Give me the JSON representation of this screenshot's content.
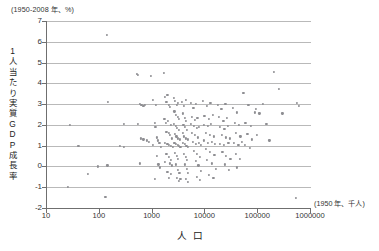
{
  "chart_data": {
    "type": "scatter",
    "title": "",
    "unit_note_y": "(1950-2008 年、%)",
    "unit_note_x": "(1950 年、千人)",
    "ylabel": "1人当たり実質GDP成長率",
    "ylabel_chars": [
      "1",
      "人",
      "当",
      "た",
      "り",
      "実",
      "質",
      "G",
      "D",
      "P",
      "成",
      "長",
      "率"
    ],
    "xlabel": "人　口",
    "xlabel_left": "人",
    "xlabel_right": "口",
    "xscale": "log",
    "yscale": "linear",
    "xlim": [
      10,
      1000000
    ],
    "ylim": [
      -2,
      7
    ],
    "xticks": [
      10,
      100,
      1000,
      10000,
      100000,
      1000000
    ],
    "xticklabels": [
      "10",
      "100",
      "1000",
      "10000",
      "100000",
      "1000000"
    ],
    "yticks": [
      -2,
      -1,
      0,
      1,
      2,
      3,
      4,
      5,
      6,
      7
    ],
    "yticklabels": [
      "-2",
      "-1",
      "0",
      "1",
      "2",
      "3",
      "4",
      "5",
      "6",
      "7"
    ],
    "grid": "horizontal",
    "legend": "none",
    "marker_color": "#8e8e92",
    "axis_color": "#6f6f6f",
    "grid_color": "#b9b9b9",
    "points": [
      [
        28,
        2.0
      ],
      [
        41,
        1.0
      ],
      [
        26,
        -1.0
      ],
      [
        140,
        6.35
      ],
      [
        150,
        3.1
      ],
      [
        95,
        0.0
      ],
      [
        145,
        0.05
      ],
      [
        62,
        -0.35
      ],
      [
        133,
        -1.45
      ],
      [
        300,
        2.05
      ],
      [
        255,
        1.0
      ],
      [
        300,
        0.95
      ],
      [
        520,
        4.45
      ],
      [
        560,
        4.4
      ],
      [
        590,
        3.0
      ],
      [
        640,
        2.95
      ],
      [
        700,
        2.9
      ],
      [
        760,
        2.95
      ],
      [
        620,
        1.35
      ],
      [
        700,
        1.3
      ],
      [
        560,
        2.05
      ],
      [
        820,
        1.25
      ],
      [
        900,
        1.2
      ],
      [
        600,
        0.15
      ],
      [
        980,
        4.35
      ],
      [
        1050,
        3.2
      ],
      [
        1200,
        2.95
      ],
      [
        1150,
        2.1
      ],
      [
        1180,
        1.9
      ],
      [
        1250,
        1.4
      ],
      [
        1320,
        1.25
      ],
      [
        1050,
        1.05
      ],
      [
        1400,
        1.15
      ],
      [
        1500,
        0.95
      ],
      [
        1250,
        0.5
      ],
      [
        1350,
        0.1
      ],
      [
        1450,
        -0.05
      ],
      [
        1150,
        -0.6
      ],
      [
        1700,
        4.5
      ],
      [
        1800,
        3.35
      ],
      [
        1900,
        3.1
      ],
      [
        2000,
        3.45
      ],
      [
        2100,
        2.95
      ],
      [
        2200,
        2.85
      ],
      [
        1750,
        2.3
      ],
      [
        1850,
        2.1
      ],
      [
        2050,
        2.2
      ],
      [
        2300,
        2.0
      ],
      [
        1900,
        1.65
      ],
      [
        2100,
        1.6
      ],
      [
        2250,
        1.5
      ],
      [
        2400,
        1.35
      ],
      [
        1800,
        1.15
      ],
      [
        2000,
        1.1
      ],
      [
        2150,
        1.05
      ],
      [
        2350,
        1.0
      ],
      [
        2500,
        0.95
      ],
      [
        1900,
        0.6
      ],
      [
        2100,
        0.45
      ],
      [
        2300,
        0.3
      ],
      [
        1800,
        0.2
      ],
      [
        2200,
        0.15
      ],
      [
        2450,
        0.05
      ],
      [
        2000,
        -0.25
      ],
      [
        2300,
        -0.35
      ],
      [
        2150,
        -0.55
      ],
      [
        2600,
        3.3
      ],
      [
        2800,
        3.15
      ],
      [
        3000,
        2.95
      ],
      [
        3200,
        3.05
      ],
      [
        2700,
        2.65
      ],
      [
        2900,
        2.5
      ],
      [
        3100,
        2.4
      ],
      [
        3300,
        2.3
      ],
      [
        2650,
        2.05
      ],
      [
        2850,
        1.95
      ],
      [
        3050,
        1.85
      ],
      [
        3250,
        1.75
      ],
      [
        2750,
        1.55
      ],
      [
        2950,
        1.45
      ],
      [
        3150,
        1.35
      ],
      [
        3400,
        1.3
      ],
      [
        2700,
        1.15
      ],
      [
        2900,
        1.1
      ],
      [
        3100,
        1.05
      ],
      [
        3300,
        1.0
      ],
      [
        3500,
        0.95
      ],
      [
        2800,
        0.65
      ],
      [
        3000,
        0.5
      ],
      [
        3200,
        0.35
      ],
      [
        2900,
        0.1
      ],
      [
        3100,
        -0.15
      ],
      [
        3350,
        -0.3
      ],
      [
        3000,
        -0.55
      ],
      [
        3250,
        -0.7
      ],
      [
        3500,
        -0.6
      ],
      [
        3800,
        3.1
      ],
      [
        4100,
        2.9
      ],
      [
        4400,
        3.2
      ],
      [
        3900,
        2.55
      ],
      [
        4200,
        2.35
      ],
      [
        4500,
        2.2
      ],
      [
        4000,
        2.0
      ],
      [
        4300,
        1.9
      ],
      [
        4600,
        1.75
      ],
      [
        3850,
        1.6
      ],
      [
        4150,
        1.45
      ],
      [
        4450,
        1.35
      ],
      [
        4800,
        1.3
      ],
      [
        3950,
        1.15
      ],
      [
        4250,
        1.1
      ],
      [
        4550,
        1.0
      ],
      [
        4900,
        0.95
      ],
      [
        4100,
        0.6
      ],
      [
        4400,
        0.45
      ],
      [
        4700,
        0.3
      ],
      [
        4200,
        0.1
      ],
      [
        4600,
        -0.1
      ],
      [
        4950,
        -0.3
      ],
      [
        4400,
        -0.6
      ],
      [
        4800,
        -0.75
      ],
      [
        5500,
        3.05
      ],
      [
        6200,
        2.8
      ],
      [
        7000,
        3.0
      ],
      [
        5800,
        2.4
      ],
      [
        6500,
        2.25
      ],
      [
        7400,
        2.35
      ],
      [
        5600,
        2.05
      ],
      [
        6300,
        1.95
      ],
      [
        7100,
        1.85
      ],
      [
        8000,
        1.9
      ],
      [
        5900,
        1.6
      ],
      [
        6700,
        1.5
      ],
      [
        7600,
        1.4
      ],
      [
        6100,
        1.2
      ],
      [
        6900,
        1.1
      ],
      [
        7800,
        1.15
      ],
      [
        8500,
        1.05
      ],
      [
        6400,
        0.75
      ],
      [
        7300,
        0.6
      ],
      [
        8200,
        0.45
      ],
      [
        6800,
        0.25
      ],
      [
        7700,
        0.05
      ],
      [
        8700,
        -0.2
      ],
      [
        7200,
        -0.5
      ],
      [
        8300,
        -0.65
      ],
      [
        9500,
        3.15
      ],
      [
        11000,
        2.9
      ],
      [
        13000,
        3.05
      ],
      [
        10000,
        2.45
      ],
      [
        12000,
        2.3
      ],
      [
        14500,
        2.5
      ],
      [
        9800,
        2.0
      ],
      [
        11500,
        1.95
      ],
      [
        13500,
        2.05
      ],
      [
        10500,
        1.6
      ],
      [
        12500,
        1.5
      ],
      [
        15000,
        1.45
      ],
      [
        9900,
        1.25
      ],
      [
        11800,
        1.15
      ],
      [
        14000,
        1.2
      ],
      [
        16000,
        1.1
      ],
      [
        10800,
        0.85
      ],
      [
        12800,
        0.7
      ],
      [
        15500,
        0.55
      ],
      [
        11200,
        0.3
      ],
      [
        13800,
        0.15
      ],
      [
        16500,
        -0.1
      ],
      [
        12200,
        -0.4
      ],
      [
        14800,
        -0.55
      ],
      [
        18000,
        2.95
      ],
      [
        21000,
        2.75
      ],
      [
        25000,
        3.0
      ],
      [
        19000,
        2.4
      ],
      [
        23000,
        2.2
      ],
      [
        27000,
        2.35
      ],
      [
        20000,
        1.9
      ],
      [
        24000,
        1.8
      ],
      [
        28000,
        1.95
      ],
      [
        21500,
        1.5
      ],
      [
        25500,
        1.4
      ],
      [
        30000,
        1.35
      ],
      [
        19500,
        1.1
      ],
      [
        23500,
        1.05
      ],
      [
        28500,
        1.15
      ],
      [
        22000,
        0.7
      ],
      [
        26000,
        0.5
      ],
      [
        31000,
        0.35
      ],
      [
        24500,
        0.1
      ],
      [
        29000,
        -0.15
      ],
      [
        35000,
        2.8
      ],
      [
        42000,
        2.6
      ],
      [
        38000,
        2.1
      ],
      [
        45000,
        2.0
      ],
      [
        40000,
        1.6
      ],
      [
        48000,
        1.45
      ],
      [
        36000,
        1.15
      ],
      [
        44000,
        1.05
      ],
      [
        52000,
        1.2
      ],
      [
        39000,
        0.6
      ],
      [
        47000,
        0.35
      ],
      [
        41000,
        -0.05
      ],
      [
        55000,
        3.55
      ],
      [
        68000,
        2.95
      ],
      [
        60000,
        2.1
      ],
      [
        75000,
        1.95
      ],
      [
        65000,
        1.55
      ],
      [
        80000,
        1.3
      ],
      [
        58000,
        1.05
      ],
      [
        72000,
        0.9
      ],
      [
        90000,
        2.6
      ],
      [
        95000,
        2.75
      ],
      [
        110000,
        2.55
      ],
      [
        100000,
        1.5
      ],
      [
        130000,
        3.0
      ],
      [
        150000,
        2.05
      ],
      [
        170000,
        1.25
      ],
      [
        210000,
        4.55
      ],
      [
        260000,
        3.75
      ],
      [
        300000,
        2.55
      ],
      [
        560000,
        3.05
      ],
      [
        620000,
        2.9
      ],
      [
        550000,
        -1.5
      ]
    ]
  }
}
